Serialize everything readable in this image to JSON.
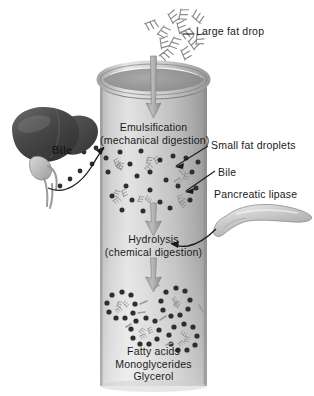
{
  "figure": {
    "background_color": "#ffffff"
  },
  "labels": {
    "large_fat_drop": "Large fat drop",
    "emulsification_line1": "Emulsification",
    "emulsification_line2": "(mechanical digestion)",
    "small_fat_droplets": "Small fat droplets",
    "bile_right": "Bile",
    "pancreatic_lipase": "Pancreatic lipase",
    "bile_left": "Bile",
    "hydrolysis_line1": "Hydrolysis",
    "hydrolysis_line2": "(chemical digestion)",
    "product_line1": "Fatty acids",
    "product_line2": "Monoglycerides",
    "product_line3": "Glycerol"
  },
  "organs": {
    "liver": "liver-organ",
    "gallbladder": "gallbladder-organ",
    "bile_duct": "bile-duct",
    "pancreas": "pancreas-organ"
  },
  "structures": {
    "tube": "test-tube-vessel",
    "large_fat_drop_cluster": "large-fat-drop-cluster",
    "small_fat_droplets_group": "small-fat-droplets-group",
    "bile_salt_dots": "bile-salt-dots",
    "micelles_group": "micelles-group",
    "flow_arrow_top": "flow-arrow-top",
    "flow_arrow_middle": "flow-arrow-middle",
    "flow_arrow_bottom": "flow-arrow-bottom",
    "leader_line_large_fat_drop": "leader-line-large-fat-drop",
    "leader_line_small_fat_droplets": "leader-line-small-fat-droplets",
    "leader_line_bile_right": "leader-line-bile-right",
    "bile_arrow_curved": "bile-arrow-curved",
    "pancreas_arrow_curved": "pancreas-arrow-curved"
  },
  "colors": {
    "ink": "#1a1a1a",
    "tube_light": "#dcdcdc",
    "tube_mid": "#b6b6b6",
    "tube_dark": "#8f8f8f",
    "liver_dark": "#3d3d3d",
    "liver_mid": "#595959",
    "pancreas": "#c9c9c9",
    "dot_dark": "#2e2e2e",
    "arrow_gray": "#9a9a9a",
    "fat_glyph": "#d0d0d0"
  }
}
